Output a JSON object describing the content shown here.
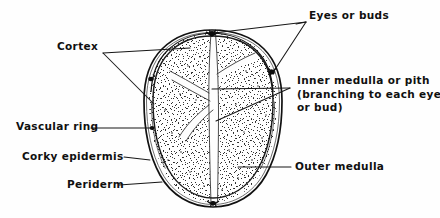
{
  "figure": {
    "width": 440,
    "height": 218,
    "background_color": "#fefefe",
    "ink_color": "#111111",
    "stipple_color": "#2a2a2a",
    "leader_color": "#1a1a1a"
  },
  "labels": {
    "eyes": "Eyes or buds",
    "cortex": "Cortex",
    "inner_medulla_line1": "Inner medulla or pith",
    "inner_medulla_line2": "(branching to each eye",
    "inner_medulla_line3": "or bud)",
    "vascular_ring": "Vascular ring",
    "corky_epidermis": "Corky epidermis",
    "periderm": "Periderm",
    "outer_medulla": "Outer medulla",
    "cutoff_caption": ""
  },
  "parts": [
    {
      "id": "eyes",
      "name": "Eyes or buds",
      "leader": "two-branch-right"
    },
    {
      "id": "cortex",
      "name": "Cortex",
      "leader": "two-branch-left"
    },
    {
      "id": "inner-medulla",
      "name": "Inner medulla or pith",
      "leader": "two-branch-right"
    },
    {
      "id": "vascular-ring",
      "name": "Vascular ring",
      "leader": "horizontal-left"
    },
    {
      "id": "corky-epidermis",
      "name": "Corky epidermis",
      "leader": "horizontal-left"
    },
    {
      "id": "periderm",
      "name": "Periderm",
      "leader": "horizontal-left"
    },
    {
      "id": "outer-medulla",
      "name": "Outer medulla",
      "leader": "horizontal-right"
    }
  ]
}
